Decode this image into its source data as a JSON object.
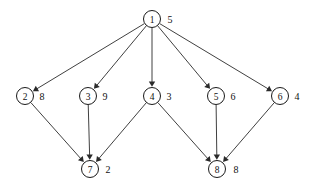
{
  "diagram": {
    "type": "directed-graph",
    "background_color": "#ffffff",
    "node_stroke_color": "#1a1a1a",
    "edge_color": "#2a2a2a",
    "text_color": "#111111",
    "node_radius": 8.5,
    "nodes": [
      {
        "id": "1",
        "label": "1",
        "weight": "5",
        "cx": 152,
        "cy": 19,
        "wx": 170,
        "wy": 19
      },
      {
        "id": "2",
        "label": "2",
        "weight": "8",
        "cx": 25,
        "cy": 96,
        "wx": 42,
        "wy": 96
      },
      {
        "id": "3",
        "label": "3",
        "weight": "9",
        "cx": 88,
        "cy": 96,
        "wx": 105,
        "wy": 96
      },
      {
        "id": "4",
        "label": "4",
        "weight": "3",
        "cx": 152,
        "cy": 96,
        "wx": 169,
        "wy": 96
      },
      {
        "id": "5",
        "label": "5",
        "weight": "6",
        "cx": 216,
        "cy": 96,
        "wx": 233,
        "wy": 96
      },
      {
        "id": "6",
        "label": "6",
        "weight": "4",
        "cx": 280,
        "cy": 96,
        "wx": 297,
        "wy": 96
      },
      {
        "id": "7",
        "label": "7",
        "weight": "2",
        "cx": 90,
        "cy": 169,
        "wx": 108,
        "wy": 169
      },
      {
        "id": "8",
        "label": "8",
        "weight": "8",
        "cx": 217,
        "cy": 169,
        "wx": 236,
        "wy": 169
      }
    ],
    "edges": [
      {
        "from": "1",
        "to": "2"
      },
      {
        "from": "1",
        "to": "3"
      },
      {
        "from": "1",
        "to": "4"
      },
      {
        "from": "1",
        "to": "5"
      },
      {
        "from": "1",
        "to": "6"
      },
      {
        "from": "2",
        "to": "7"
      },
      {
        "from": "3",
        "to": "7"
      },
      {
        "from": "4",
        "to": "7"
      },
      {
        "from": "4",
        "to": "8"
      },
      {
        "from": "5",
        "to": "8"
      },
      {
        "from": "6",
        "to": "8"
      }
    ]
  }
}
